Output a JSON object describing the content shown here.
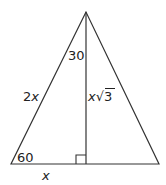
{
  "diagram": {
    "type": "30-60-90 triangle inside isosceles triangle",
    "colors": {
      "stroke": "#333333",
      "text": "#222222",
      "background": "#ffffff"
    },
    "labels": {
      "apex_angle": "30",
      "base_angle": "60",
      "hypotenuse": "2x",
      "short_leg": "x",
      "altitude_var": "x",
      "altitude_root": "√",
      "altitude_radicand": "3"
    },
    "right_angle_marker": true
  }
}
